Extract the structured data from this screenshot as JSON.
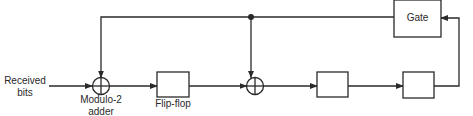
{
  "diagram": {
    "type": "block-diagram",
    "labels": {
      "input": [
        "Received",
        "bits"
      ],
      "adder": [
        "Modulo-2",
        "adder"
      ],
      "flipflop": "Flip-flop",
      "gate": "Gate"
    },
    "nodes": [
      {
        "id": "input",
        "label": "Received bits"
      },
      {
        "id": "adder1",
        "label": "Modulo-2 adder",
        "shape": "xor-circle"
      },
      {
        "id": "ff1",
        "label": "Flip-flop",
        "shape": "box"
      },
      {
        "id": "adder2",
        "label": "",
        "shape": "xor-circle"
      },
      {
        "id": "ff2",
        "label": "",
        "shape": "box"
      },
      {
        "id": "ff3",
        "label": "",
        "shape": "box"
      },
      {
        "id": "gate",
        "label": "Gate",
        "shape": "box"
      }
    ],
    "edges": [
      {
        "from": "input",
        "to": "adder1"
      },
      {
        "from": "adder1",
        "to": "ff1"
      },
      {
        "from": "ff1",
        "to": "adder2"
      },
      {
        "from": "adder2",
        "to": "ff2"
      },
      {
        "from": "ff2",
        "to": "ff3"
      },
      {
        "from": "ff3",
        "to": "gate"
      },
      {
        "from": "gate",
        "to": "junction"
      },
      {
        "from": "junction",
        "to": "adder2"
      },
      {
        "from": "junction",
        "to": "adder1"
      }
    ],
    "colors": {
      "stroke": "#2a2a2a",
      "background": "#ffffff"
    }
  }
}
